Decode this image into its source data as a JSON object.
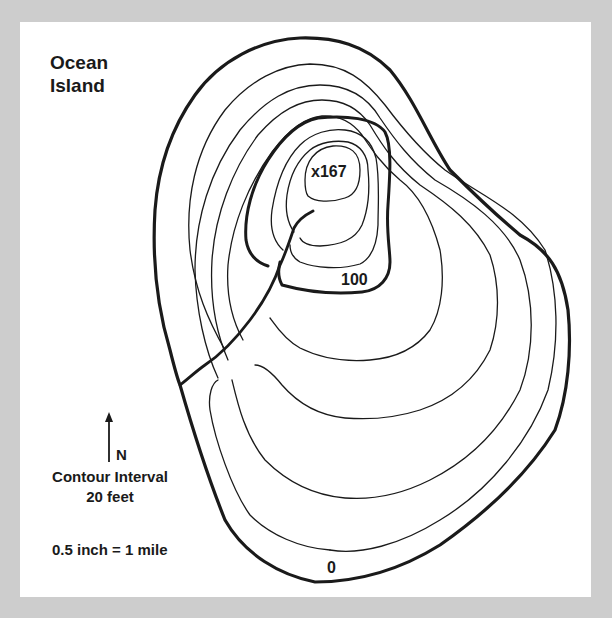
{
  "map": {
    "title_line1": "Ocean",
    "title_line2": "Island",
    "peak_label": "x167",
    "index_contour_label": "100",
    "coast_label": "0",
    "north_arrow_label": "N",
    "legend": {
      "contour_interval_line1": "Contour Interval",
      "contour_interval_line2": "20 feet",
      "scale": "0.5 inch = 1 mile"
    },
    "contour_interval_feet": 20,
    "peak_elevation_feet": 167,
    "contours_feet": [
      0,
      20,
      40,
      60,
      80,
      100,
      120,
      140,
      160
    ],
    "colors": {
      "background": "#cdcdcd",
      "panel": "#ffffff",
      "line": "#1a1a1a"
    },
    "icons": {
      "north_arrow": "arrow-up-icon"
    }
  }
}
